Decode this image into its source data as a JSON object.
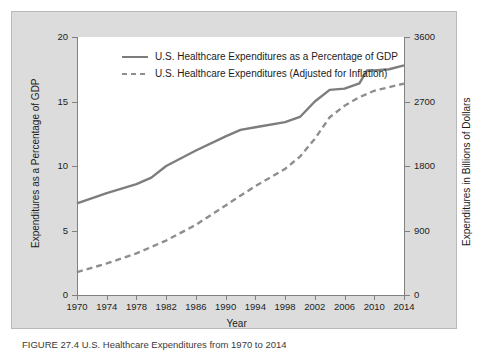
{
  "chart_data": {
    "type": "line",
    "title": "",
    "xlabel": "Year",
    "ylabel": "Expenditures as a Percentage of GDP",
    "y2label": "Expenditures in Billions of Dollars",
    "xlim": [
      1970,
      2014
    ],
    "ylim": [
      0,
      20
    ],
    "y2lim": [
      0,
      3600
    ],
    "grid": false,
    "legend_position": "top-center-inside",
    "x_ticks": [
      1970,
      1974,
      1978,
      1982,
      1986,
      1990,
      1994,
      1998,
      2002,
      2006,
      2010,
      2014
    ],
    "y_ticks": [
      0,
      5,
      10,
      15,
      20
    ],
    "y2_ticks": [
      0,
      900,
      1800,
      2700,
      3600
    ],
    "series": [
      {
        "name": "U.S. Healthcare Expenditures as a Percentage of GDP",
        "axis": "left",
        "style": "solid",
        "color": "#7d7d7d",
        "x": [
          1970,
          1974,
          1978,
          1980,
          1982,
          1986,
          1990,
          1992,
          1994,
          1998,
          2000,
          2002,
          2004,
          2006,
          2008,
          2009,
          2010,
          2012,
          2014
        ],
        "values": [
          7.1,
          7.9,
          8.6,
          9.1,
          10.0,
          11.2,
          12.3,
          12.8,
          13.0,
          13.4,
          13.8,
          15.0,
          15.9,
          16.0,
          16.4,
          17.4,
          17.4,
          17.5,
          17.8
        ]
      },
      {
        "name": "U.S. Healthcare Expenditures (Adjusted for Inflation)",
        "axis": "right",
        "style": "dashed",
        "color": "#8e8e8e",
        "x": [
          1970,
          1974,
          1978,
          1982,
          1986,
          1990,
          1994,
          1998,
          2000,
          2002,
          2004,
          2006,
          2008,
          2010,
          2012,
          2014
        ],
        "values": [
          320,
          440,
          580,
          760,
          980,
          1250,
          1520,
          1760,
          1930,
          2180,
          2480,
          2640,
          2760,
          2850,
          2900,
          2950
        ]
      }
    ]
  },
  "axes": {
    "left_title": "Expenditures as a Percentage of GDP",
    "right_title": "Expenditures in Billions of Dollars",
    "x_title": "Year",
    "left_ticks": [
      "20",
      "15",
      "10",
      "5",
      "0"
    ],
    "right_ticks": [
      "3600",
      "2700",
      "1800",
      "900",
      "0"
    ],
    "x_ticks": [
      "1970",
      "1974",
      "1978",
      "1982",
      "1986",
      "1990",
      "1994",
      "1998",
      "2002",
      "2006",
      "2010",
      "2014"
    ]
  },
  "legend": {
    "items": [
      {
        "label": "U.S. Healthcare Expenditures as a Percentage of GDP",
        "style": "solid"
      },
      {
        "label": "U.S. Healthcare Expenditures (Adjusted for Inflation)",
        "style": "dashed"
      }
    ]
  },
  "caption": {
    "text": "FIGURE 27.4  U.S. Healthcare Expenditures from 1970 to 2014"
  },
  "colors": {
    "panel_background": "#dcdcdc",
    "plot_background": "#ffffff",
    "axis": "#808080",
    "series_solid": "#7d7d7d",
    "series_dashed": "#8e8e8e",
    "text": "#1c1c1c"
  }
}
